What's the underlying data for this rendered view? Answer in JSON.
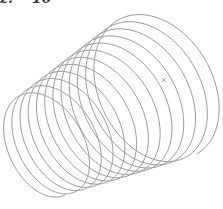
{
  "figure": {
    "label_prefix": "z.",
    "label_number": "10"
  },
  "diagram": {
    "type": "conical-helix",
    "turns": 12,
    "stroke_color": "#9a9a9a",
    "start": {
      "cx": 40,
      "cy": 147,
      "rx": 34,
      "ry": 54
    },
    "end": {
      "cx": 160,
      "cy": 85,
      "rx": 55,
      "ry": 78
    },
    "tilt_deg": -28,
    "marker": {
      "x": 164,
      "y": 80,
      "symbol": "×"
    }
  }
}
